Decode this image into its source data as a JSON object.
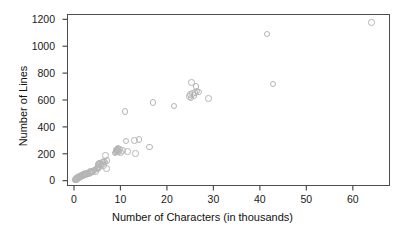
{
  "chart_data": {
    "type": "scatter",
    "title": "",
    "xlabel": "Number of Characters (in thousands)",
    "ylabel": "Number of Lines",
    "xlim": [
      -1.5,
      68
    ],
    "ylim": [
      -40,
      1240
    ],
    "xticks": [
      0,
      10,
      20,
      30,
      40,
      50,
      60
    ],
    "xtick_labels": [
      "0",
      "10",
      "20",
      "30",
      "40",
      "50",
      "60"
    ],
    "yticks": [
      0,
      200,
      400,
      600,
      800,
      1000,
      1200
    ],
    "ytick_labels": [
      "0",
      "200",
      "400",
      "600",
      "800",
      "1000",
      "1200"
    ],
    "grid": false,
    "legend": null,
    "marker": {
      "shape": "circle-open",
      "color": "#b5b5b5",
      "size": 6.6,
      "line_width": 1.1
    },
    "frame_color": "#4d4d4d",
    "background": "#ffffff",
    "n_points": 78,
    "points": [
      [
        0.2,
        5
      ],
      [
        0.3,
        8
      ],
      [
        0.4,
        12
      ],
      [
        0.5,
        10
      ],
      [
        0.6,
        18
      ],
      [
        0.7,
        15
      ],
      [
        0.8,
        22
      ],
      [
        0.9,
        20
      ],
      [
        1.0,
        28
      ],
      [
        1.1,
        25
      ],
      [
        1.2,
        30
      ],
      [
        1.3,
        26
      ],
      [
        1.4,
        35
      ],
      [
        1.5,
        32
      ],
      [
        1.6,
        38
      ],
      [
        1.8,
        40
      ],
      [
        1.9,
        36
      ],
      [
        2.0,
        45
      ],
      [
        2.2,
        42
      ],
      [
        2.3,
        48
      ],
      [
        2.5,
        52
      ],
      [
        2.6,
        46
      ],
      [
        2.8,
        55
      ],
      [
        3.0,
        58
      ],
      [
        3.1,
        50
      ],
      [
        3.3,
        62
      ],
      [
        3.5,
        60
      ],
      [
        3.6,
        68
      ],
      [
        3.8,
        64
      ],
      [
        4.0,
        72
      ],
      [
        4.1,
        66
      ],
      [
        4.3,
        78
      ],
      [
        4.5,
        80
      ],
      [
        4.6,
        70
      ],
      [
        4.8,
        85
      ],
      [
        5.0,
        95
      ],
      [
        5.1,
        88
      ],
      [
        5.2,
        120
      ],
      [
        5.3,
        105
      ],
      [
        5.4,
        128
      ],
      [
        5.5,
        100
      ],
      [
        5.6,
        132
      ],
      [
        5.8,
        118
      ],
      [
        6.0,
        125
      ],
      [
        6.1,
        140
      ],
      [
        6.3,
        112
      ],
      [
        6.5,
        145
      ],
      [
        6.7,
        138
      ],
      [
        6.8,
        185
      ],
      [
        7.0,
        90
      ],
      [
        7.1,
        150
      ],
      [
        8.8,
        205
      ],
      [
        9.0,
        218
      ],
      [
        9.1,
        228
      ],
      [
        9.2,
        212
      ],
      [
        9.3,
        232
      ],
      [
        9.4,
        222
      ],
      [
        9.5,
        240
      ],
      [
        9.6,
        215
      ],
      [
        9.8,
        235
      ],
      [
        10.0,
        208
      ],
      [
        10.5,
        225
      ],
      [
        11.0,
        515
      ],
      [
        11.2,
        295
      ],
      [
        11.5,
        218
      ],
      [
        13.0,
        300
      ],
      [
        13.2,
        200
      ],
      [
        14.0,
        305
      ],
      [
        16.3,
        250
      ],
      [
        17.0,
        580
      ],
      [
        21.5,
        555
      ],
      [
        24.8,
        625
      ],
      [
        25.0,
        640
      ],
      [
        25.2,
        615
      ],
      [
        25.3,
        730
      ],
      [
        25.5,
        648
      ],
      [
        25.8,
        632
      ],
      [
        26.0,
        655
      ],
      [
        26.3,
        700
      ],
      [
        26.5,
        668
      ],
      [
        26.8,
        660
      ],
      [
        29.0,
        610
      ],
      [
        41.5,
        1090
      ],
      [
        42.8,
        720
      ],
      [
        64.0,
        1175
      ]
    ]
  }
}
